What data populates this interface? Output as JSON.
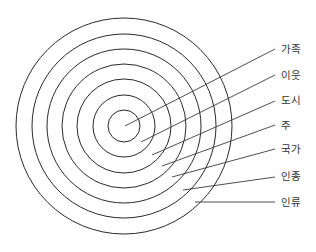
{
  "diagram": {
    "type": "concentric-circles",
    "center": [
      124,
      126
    ],
    "ring_radii": [
      16,
      31,
      47,
      62,
      77,
      92,
      108
    ],
    "colors": {
      "ring": "#2a2a2a",
      "leader": "#3a3a3a",
      "text": "#333333"
    },
    "labels": [
      {
        "text": "가족",
        "from": [
          125,
          126
        ],
        "to": [
          275,
          49
        ],
        "label_pos": [
          281,
          49
        ]
      },
      {
        "text": "이웃",
        "from": [
          141,
          142
        ],
        "to": [
          275,
          75
        ],
        "label_pos": [
          281,
          75
        ]
      },
      {
        "text": "도시",
        "from": [
          152,
          155
        ],
        "to": [
          275,
          101
        ],
        "label_pos": [
          281,
          100
        ]
      },
      {
        "text": "주",
        "from": [
          162,
          166
        ],
        "to": [
          275,
          125
        ],
        "label_pos": [
          281,
          125
        ]
      },
      {
        "text": "국가",
        "from": [
          172,
          177
        ],
        "to": [
          275,
          149
        ],
        "label_pos": [
          281,
          149
        ]
      },
      {
        "text": "인종",
        "from": [
          183,
          190
        ],
        "to": [
          275,
          177
        ],
        "label_pos": [
          281,
          176
        ]
      },
      {
        "text": "인류",
        "from": [
          195,
          202
        ],
        "to": [
          275,
          202
        ],
        "label_pos": [
          281,
          202
        ]
      }
    ]
  }
}
